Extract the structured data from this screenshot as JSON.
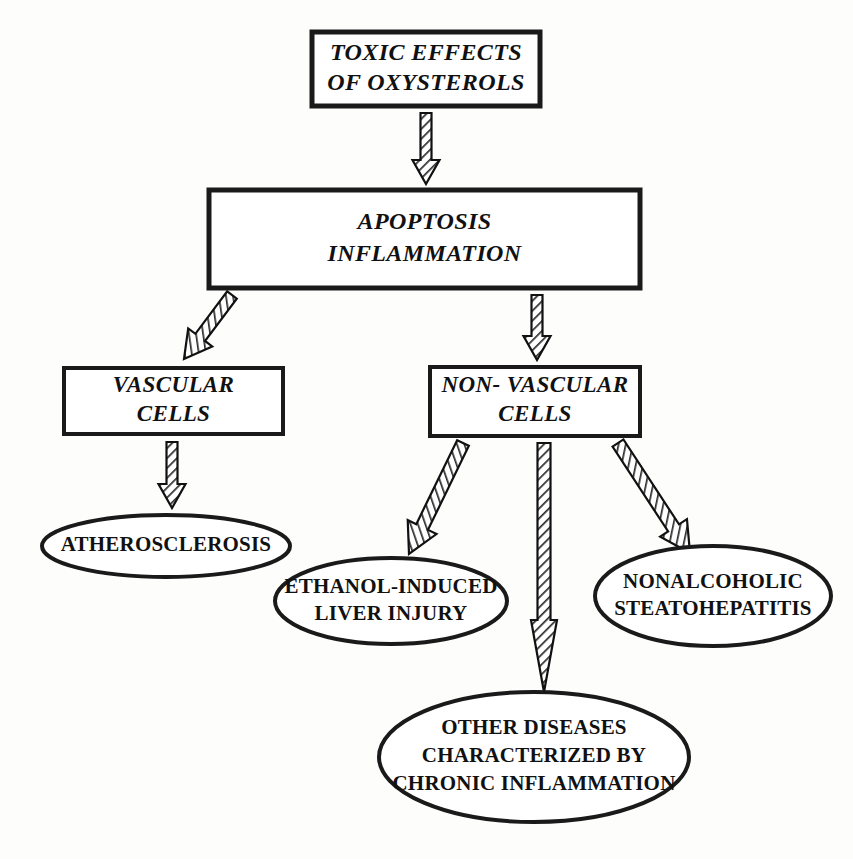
{
  "diagram": {
    "colors": {
      "background": "#fdfdfc",
      "stroke": "#1a1a1a",
      "text": "#111111",
      "hatch": "#2b2b2b",
      "node_fill": "#ffffff"
    },
    "boxes": [
      {
        "id": "toxic-effects",
        "name": "toxic-effects-of-oxysterols",
        "lines": [
          "TOXIC EFFECTS",
          "OF OXYSTEROLS"
        ],
        "x": 312,
        "y": 32,
        "w": 228,
        "h": 74,
        "font_size": 24,
        "line_height": 30,
        "border": 5
      },
      {
        "id": "apoptosis-inflammation",
        "name": "apoptosis-inflammation",
        "lines": [
          "APOPTOSIS",
          "INFLAMMATION"
        ],
        "x": 209,
        "y": 190,
        "w": 431,
        "h": 98,
        "font_size": 24,
        "line_height": 32,
        "border": 5
      },
      {
        "id": "vascular-cells",
        "name": "vascular-cells",
        "lines": [
          "VASCULAR",
          "CELLS"
        ],
        "x": 64,
        "y": 368,
        "w": 219,
        "h": 66,
        "font_size": 23,
        "line_height": 29,
        "border": 4
      },
      {
        "id": "non-vascular-cells",
        "name": "non-vascular-cells",
        "lines": [
          "NON- VASCULAR",
          "CELLS"
        ],
        "x": 430,
        "y": 367,
        "w": 210,
        "h": 69,
        "font_size": 23,
        "line_height": 29,
        "border": 4
      }
    ],
    "ellipses": [
      {
        "id": "atherosclerosis",
        "name": "atherosclerosis",
        "lines": [
          "ATHEROSCLEROSIS"
        ],
        "cx": 166,
        "cy": 546,
        "rx": 124,
        "ry": 31,
        "font_size": 21,
        "line_height": 26,
        "border": 4
      },
      {
        "id": "ethanol-induced-liver-injury",
        "name": "ethanol-induced-liver-injury",
        "lines": [
          "ETHANOL-INDUCED",
          "LIVER INJURY"
        ],
        "cx": 391,
        "cy": 601,
        "rx": 116,
        "ry": 43,
        "font_size": 21,
        "line_height": 27,
        "border": 4
      },
      {
        "id": "nonalcoholic-steatohepatitis",
        "name": "nonalcoholic-steatohepatitis",
        "lines": [
          "NONALCOHOLIC",
          "STEATOHEPATITIS"
        ],
        "cx": 713,
        "cy": 596,
        "rx": 118,
        "ry": 50,
        "font_size": 21,
        "line_height": 27,
        "border": 4
      },
      {
        "id": "other-diseases",
        "name": "other-diseases-chronic-inflammation",
        "lines": [
          "OTHER DISEASES",
          "CHARACTERIZED BY",
          "CHRONIC INFLAMMATION"
        ],
        "cx": 534,
        "cy": 757,
        "rx": 155,
        "ry": 65,
        "font_size": 21,
        "line_height": 28,
        "border": 4
      }
    ],
    "arrows": [
      {
        "id": "arrow-toxic-to-apoptosis",
        "name": "arrow-toxic-to-apoptosis",
        "from": "toxic-effects",
        "to": "apoptosis-inflammation",
        "x1": 426,
        "y1": 113,
        "x2": 426,
        "y2": 184,
        "shaft_w": 11,
        "head_w": 27,
        "head_len": 24
      },
      {
        "id": "arrow-apoptosis-to-vascular",
        "name": "arrow-apoptosis-to-vascular",
        "from": "apoptosis-inflammation",
        "to": "vascular-cells",
        "x1": 232,
        "y1": 295,
        "x2": 184,
        "y2": 359,
        "shaft_w": 12,
        "head_w": 30,
        "head_len": 27
      },
      {
        "id": "arrow-apoptosis-to-nonvascular",
        "name": "arrow-apoptosis-to-nonvascular",
        "from": "apoptosis-inflammation",
        "to": "non-vascular-cells",
        "x1": 537,
        "y1": 295,
        "x2": 537,
        "y2": 360,
        "shaft_w": 11,
        "head_w": 27,
        "head_len": 24
      },
      {
        "id": "arrow-vascular-to-atherosclerosis",
        "name": "arrow-vascular-to-atherosclerosis",
        "from": "vascular-cells",
        "to": "atherosclerosis",
        "x1": 172,
        "y1": 442,
        "x2": 172,
        "y2": 508,
        "shaft_w": 11,
        "head_w": 27,
        "head_len": 24
      },
      {
        "id": "arrow-nonvascular-to-ethanol",
        "name": "arrow-nonvascular-to-ethanol",
        "from": "non-vascular-cells",
        "to": "ethanol-induced-liver-injury",
        "x1": 463,
        "y1": 443,
        "x2": 409,
        "y2": 554,
        "shaft_w": 13,
        "head_w": 32,
        "head_len": 30
      },
      {
        "id": "arrow-nonvascular-to-other",
        "name": "arrow-nonvascular-to-other",
        "from": "non-vascular-cells",
        "to": "other-diseases",
        "x1": 544,
        "y1": 443,
        "x2": 544,
        "y2": 692,
        "shaft_w": 13,
        "head_w": 26,
        "head_len": 72
      },
      {
        "id": "arrow-nonvascular-to-nash",
        "name": "arrow-nonvascular-to-nash",
        "from": "non-vascular-cells",
        "to": "nonalcoholic-steatohepatitis",
        "x1": 618,
        "y1": 443,
        "x2": 690,
        "y2": 553,
        "shaft_w": 13,
        "head_w": 32,
        "head_len": 30
      }
    ]
  }
}
